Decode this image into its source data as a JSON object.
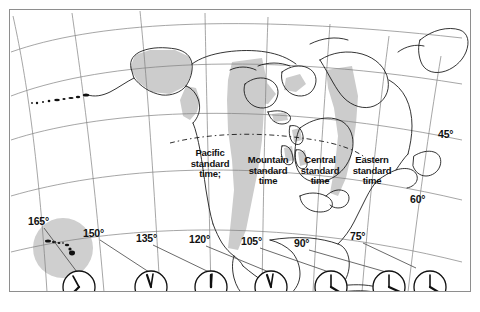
{
  "map": {
    "title": "North America standard time zones",
    "frame_color": "#8e8e8e",
    "land_outline_color": "#1a1a1a",
    "shade_color": "#c9c9c9",
    "graticule_color": "#7a7a7a",
    "background": "#ffffff"
  },
  "timezones": [
    {
      "id": "pacific",
      "line1": "Pacific",
      "line2": "standard",
      "line3": "time;"
    },
    {
      "id": "mountain",
      "line1": "Mountain",
      "line2": "standard",
      "line3": "time"
    },
    {
      "id": "central",
      "line1": "Central",
      "line2": "standard",
      "line3": "time"
    },
    {
      "id": "eastern",
      "line1": "Eastern",
      "line2": "standard",
      "line3": "time"
    }
  ],
  "longitudes": [
    {
      "id": "lon-165",
      "label": "165°"
    },
    {
      "id": "lon-150",
      "label": "150°"
    },
    {
      "id": "lon-135",
      "label": "135°"
    },
    {
      "id": "lon-120",
      "label": "120°"
    },
    {
      "id": "lon-105",
      "label": "105°"
    },
    {
      "id": "lon-90",
      "label": "90°"
    },
    {
      "id": "lon-75",
      "label": "75°"
    }
  ],
  "latitudes": [
    {
      "id": "lat-45",
      "label": "45°"
    },
    {
      "id": "lat-60",
      "label": "60°"
    }
  ],
  "clocks": [
    {
      "id": "clock-165",
      "zone": "Hawaii-Aleutian",
      "hour_deg": 315,
      "minute_deg": 225
    },
    {
      "id": "clock-150",
      "zone": "Alaska",
      "hour_deg": 200,
      "minute_deg": 175
    },
    {
      "id": "clock-135",
      "zone": "Yukon",
      "hour_deg": 180,
      "minute_deg": 178
    },
    {
      "id": "clock-120",
      "zone": "Pacific",
      "hour_deg": 200,
      "minute_deg": 170
    },
    {
      "id": "clock-105",
      "zone": "Mountain",
      "hour_deg": 120,
      "minute_deg": 185
    },
    {
      "id": "clock-90",
      "zone": "Central",
      "hour_deg": 105,
      "minute_deg": 180
    },
    {
      "id": "clock-75",
      "zone": "Eastern",
      "hour_deg": 120,
      "minute_deg": 185
    }
  ],
  "inset": {
    "id": "hawaii-inset",
    "name": "Hawaiian Islands"
  }
}
